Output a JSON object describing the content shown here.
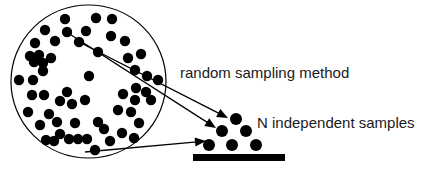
{
  "figure": {
    "labels": {
      "method": "random sampling method",
      "samples": "N independent samples"
    },
    "colors": {
      "ink": "#000000",
      "text": "#1a1a1a",
      "background": "#ffffff"
    }
  },
  "chart_data": {
    "type": "scatter",
    "title": "",
    "xlabel": "",
    "ylabel": "",
    "xlim": [
      0,
      440
    ],
    "ylim": [
      0,
      171
    ],
    "grid": false,
    "legend": "none",
    "annotations": [
      {
        "name": "method-label",
        "text": "random sampling method",
        "x": 180,
        "y": 78
      },
      {
        "name": "samples-label",
        "text": "N independent samples",
        "x": 257,
        "y": 128
      }
    ],
    "shapes": [
      {
        "name": "population-boundary",
        "type": "ellipse",
        "cx": 88.5,
        "cy": 81.5,
        "rx": 77.5,
        "ry": 76.5
      },
      {
        "name": "sample-baseline-bar",
        "type": "rect",
        "x": 193,
        "y": 154,
        "width": 92,
        "height": 7
      }
    ],
    "arrows": [
      {
        "name": "sampling-arrow-upper",
        "x1": 79,
        "y1": 42,
        "x2": 228,
        "y2": 118
      },
      {
        "name": "sampling-arrow-middle",
        "x1": 68,
        "y1": 33,
        "x2": 216,
        "y2": 128
      },
      {
        "name": "sampling-arrow-lower",
        "x1": 85,
        "y1": 152,
        "x2": 206,
        "y2": 141
      }
    ],
    "series": [
      {
        "name": "population",
        "marker": "filled-circle",
        "radius": 5.2,
        "count": 57,
        "points": [
          [
            65,
            19
          ],
          [
            96,
            18
          ],
          [
            112,
            19
          ],
          [
            45,
            30
          ],
          [
            67,
            32
          ],
          [
            86,
            31
          ],
          [
            35,
            43
          ],
          [
            55,
            41
          ],
          [
            79,
            42
          ],
          [
            111,
            36
          ],
          [
            125,
            41
          ],
          [
            30,
            56
          ],
          [
            39,
            55
          ],
          [
            34,
            62
          ],
          [
            43,
            63
          ],
          [
            51,
            58
          ],
          [
            43,
            71
          ],
          [
            98,
            52
          ],
          [
            128,
            58
          ],
          [
            141,
            54
          ],
          [
            19,
            80
          ],
          [
            33,
            80
          ],
          [
            135,
            70
          ],
          [
            147,
            76
          ],
          [
            89,
            76
          ],
          [
            158,
            80
          ],
          [
            32,
            95
          ],
          [
            44,
            95
          ],
          [
            67,
            92
          ],
          [
            60,
            101
          ],
          [
            72,
            104
          ],
          [
            85,
            100
          ],
          [
            123,
            94
          ],
          [
            136,
            88
          ],
          [
            146,
            92
          ],
          [
            135,
            100
          ],
          [
            28,
            112
          ],
          [
            49,
            114
          ],
          [
            57,
            122
          ],
          [
            118,
            110
          ],
          [
            131,
            112
          ],
          [
            40,
            125
          ],
          [
            75,
            123
          ],
          [
            98,
            122
          ],
          [
            139,
            123
          ],
          [
            60,
            134
          ],
          [
            69,
            139
          ],
          [
            78,
            139
          ],
          [
            87,
            139
          ],
          [
            122,
            133
          ],
          [
            134,
            138
          ],
          [
            104,
            129
          ],
          [
            110,
            141
          ],
          [
            46,
            140
          ],
          [
            54,
            141
          ],
          [
            95,
            150
          ],
          [
            151,
            100
          ]
        ]
      },
      {
        "name": "independent-samples",
        "marker": "filled-circle",
        "radius": 6.0,
        "count": 6,
        "points": [
          [
            236,
            119
          ],
          [
            222,
            131
          ],
          [
            246,
            131
          ],
          [
            209,
            145
          ],
          [
            232,
            145
          ],
          [
            256,
            145
          ]
        ]
      }
    ]
  }
}
